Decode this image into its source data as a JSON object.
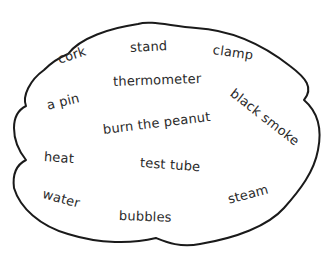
{
  "diagram": {
    "type": "word-cloud",
    "outline_color": "#1a1a1a",
    "text_color": "#2a2a2a",
    "words": [
      {
        "text": "cork",
        "x": 58,
        "y": 52,
        "rotate": -18
      },
      {
        "text": "stand",
        "x": 130,
        "y": 40,
        "rotate": -3
      },
      {
        "text": "clamp",
        "x": 213,
        "y": 44,
        "rotate": 8
      },
      {
        "text": "thermometer",
        "x": 113,
        "y": 74,
        "rotate": -2
      },
      {
        "text": "black smoke",
        "x": 230,
        "y": 88,
        "rotate": 38
      },
      {
        "text": "a pin",
        "x": 47,
        "y": 98,
        "rotate": -14
      },
      {
        "text": "burn the peanut",
        "x": 103,
        "y": 118,
        "rotate": -7
      },
      {
        "text": "heat",
        "x": 44,
        "y": 149,
        "rotate": 4
      },
      {
        "text": "test tube",
        "x": 140,
        "y": 157,
        "rotate": 4
      },
      {
        "text": "steam",
        "x": 228,
        "y": 190,
        "rotate": -15
      },
      {
        "text": "water",
        "x": 43,
        "y": 189,
        "rotate": 15
      },
      {
        "text": "bubbles",
        "x": 119,
        "y": 209,
        "rotate": 2
      }
    ]
  }
}
